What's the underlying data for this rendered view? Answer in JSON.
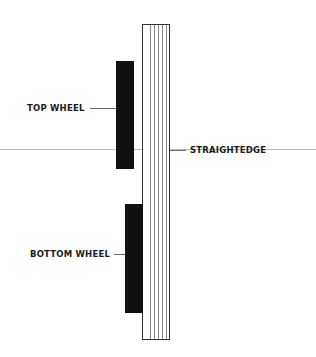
{
  "diagram": {
    "labels": {
      "top_wheel": "TOP WHEEL",
      "straightedge": "STRAIGHTEDGE",
      "bottom_wheel": "BOTTOM WHEEL"
    },
    "colors": {
      "wheel": "#111111",
      "outline": "#333333",
      "reference_line": "#bbbbbb"
    }
  }
}
